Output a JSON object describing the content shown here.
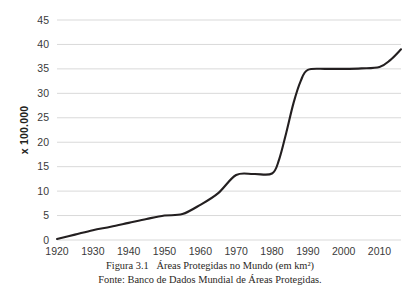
{
  "chart_data": {
    "type": "line",
    "title": "",
    "xlabel": "",
    "ylabel": "x 100.000",
    "xlim": [
      1920,
      2016
    ],
    "ylim": [
      0,
      45
    ],
    "grid": true,
    "legend": false,
    "xticks": [
      "1920",
      "1930",
      "1940",
      "1950",
      "1960",
      "1970",
      "1980",
      "1990",
      "2000",
      "2010"
    ],
    "xtick_values": [
      1920,
      1930,
      1940,
      1950,
      1960,
      1970,
      1980,
      1990,
      2000,
      2010
    ],
    "yticks": [
      "0",
      "5",
      "10",
      "15",
      "20",
      "25",
      "30",
      "35",
      "40",
      "45"
    ],
    "ytick_values": [
      0,
      5,
      10,
      15,
      20,
      25,
      30,
      35,
      40,
      45
    ],
    "line_color": "#231f20",
    "grid_color": "#d9d9d9",
    "series": [
      {
        "name": "Áreas Protegidas no Mundo",
        "x": [
          1920,
          1925,
          1930,
          1935,
          1940,
          1945,
          1950,
          1955,
          1960,
          1965,
          1970,
          1975,
          1980,
          1982,
          1984,
          1986,
          1988,
          1990,
          1995,
          2000,
          2005,
          2010,
          2013,
          2016
        ],
        "values": [
          0.2,
          1.1,
          2.0,
          2.7,
          3.5,
          4.3,
          5.0,
          5.3,
          7.2,
          9.6,
          13.3,
          13.5,
          13.6,
          16.5,
          22.0,
          28.0,
          32.5,
          34.8,
          35.0,
          35.0,
          35.1,
          35.4,
          36.8,
          39.0
        ]
      }
    ]
  },
  "caption": {
    "line1": "Figura 3.1   Áreas Protegidas no Mundo (em km²)",
    "line2": "Fonte: Banco de Dados Mundial de Áreas Protegidas."
  }
}
